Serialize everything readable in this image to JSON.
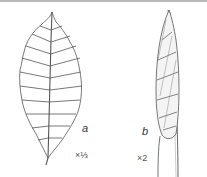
{
  "figure": {
    "panel_a": {
      "label": "a",
      "scale": "×⅓",
      "subject": "leaf"
    },
    "panel_b": {
      "label": "b",
      "scale": "×2",
      "subject": "bud"
    }
  }
}
